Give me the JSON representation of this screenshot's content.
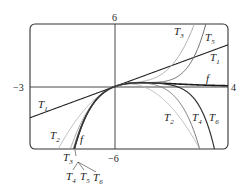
{
  "chart_data": {
    "type": "line",
    "title": "",
    "function": "f(x) = x e^(-x) and Taylor polynomials T1..T6 about 0",
    "xlim": [
      -3,
      4
    ],
    "ylim": [
      -6,
      6
    ],
    "axis_labels": {
      "xmin": "−3",
      "xmax": "4",
      "ymax": "6",
      "ymin": "−6"
    },
    "grid": false,
    "series": [
      {
        "name": "f",
        "color": "#1a1a1a",
        "width": 1.6,
        "coeffs": null
      },
      {
        "name": "T1",
        "color": "#222222",
        "width": 1.1,
        "coeffs": [
          0,
          1
        ]
      },
      {
        "name": "T2",
        "color": "#b8b8b8",
        "width": 1.0,
        "coeffs": [
          0,
          1,
          -1
        ]
      },
      {
        "name": "T3",
        "color": "#a8a8a8",
        "width": 1.0,
        "coeffs": [
          0,
          1,
          -1,
          0.5
        ]
      },
      {
        "name": "T4",
        "color": "#777777",
        "width": 1.0,
        "coeffs": [
          0,
          1,
          -1,
          0.5,
          -0.16667
        ]
      },
      {
        "name": "T5",
        "color": "#666666",
        "width": 1.0,
        "coeffs": [
          0,
          1,
          -1,
          0.5,
          -0.16667,
          0.041667
        ]
      },
      {
        "name": "T6",
        "color": "#333333",
        "width": 1.2,
        "coeffs": [
          0,
          1,
          -1,
          0.5,
          -0.16667,
          0.041667,
          -0.0083333
        ]
      }
    ],
    "curve_labels": [
      {
        "text": "T",
        "sub": "3",
        "x": 174,
        "y": 35
      },
      {
        "text": "T",
        "sub": "5",
        "x": 205,
        "y": 41
      },
      {
        "text": "T",
        "sub": "1",
        "x": 210,
        "y": 61
      },
      {
        "text": "f",
        "x": 206,
        "y": 82
      },
      {
        "text": "T",
        "sub": "1",
        "x": 38,
        "y": 108
      },
      {
        "text": "T",
        "sub": "2",
        "x": 164,
        "y": 121
      },
      {
        "text": "T",
        "sub": "4",
        "x": 192,
        "y": 121
      },
      {
        "text": "T",
        "sub": "6",
        "x": 209,
        "y": 121
      },
      {
        "text": "T",
        "sub": "2",
        "x": 50,
        "y": 139
      },
      {
        "text": "f",
        "x": 80,
        "y": 143
      },
      {
        "text": "T",
        "sub": "3",
        "x": 63,
        "y": 161
      },
      {
        "text": "T",
        "sub": "4",
        "x": 66,
        "y": 180
      },
      {
        "text": "T",
        "sub": "5",
        "x": 80,
        "y": 180
      },
      {
        "text": "T",
        "sub": "6",
        "x": 93,
        "y": 181
      }
    ]
  }
}
